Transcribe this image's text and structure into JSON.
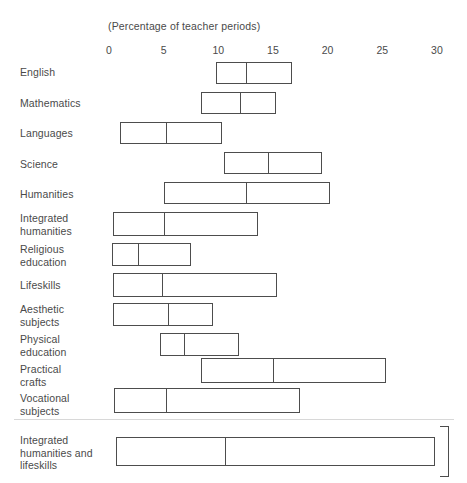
{
  "axis": {
    "caption": "(Percentage of teacher periods)",
    "ticks": [
      {
        "label": "0",
        "value": 0
      },
      {
        "label": "5",
        "value": 5
      },
      {
        "label": "10",
        "value": 10
      },
      {
        "label": "15",
        "value": 15
      },
      {
        "label": "20",
        "value": 20
      },
      {
        "label": "25",
        "value": 25
      },
      {
        "label": "30",
        "value": 30
      }
    ]
  },
  "colors": {
    "bar_outline": "#4d4d4d",
    "bar_fill": "#ffffff",
    "text": "#4a4a4a"
  },
  "chart_data": {
    "type": "bar",
    "title": "",
    "subtitle": "(Percentage of teacher periods)",
    "xlabel": "Percentage of teacher periods",
    "ylabel": "",
    "xlim": [
      0,
      30
    ],
    "grid": false,
    "legend": null,
    "orientation": "horizontal",
    "note": "Each row is a floating range bar (min to max) with an internal divider line marking the median.",
    "categories": [
      "English",
      "Mathematics",
      "Languages",
      "Science",
      "Humanities",
      "Integrated humanities",
      "Religious education",
      "Lifeskills",
      "Aesthetic subjects",
      "Physical education",
      "Practical crafts",
      "Vocational subjects",
      "Integrated humanities and lifeskills"
    ],
    "series": [
      {
        "name": "low",
        "values": [
          9.8,
          8.4,
          1.0,
          10.5,
          5.0,
          0.4,
          0.3,
          0.4,
          0.4,
          4.7,
          8.4,
          0.5,
          0.6
        ]
      },
      {
        "name": "median",
        "values": [
          12.4,
          11.9,
          5.1,
          14.5,
          12.4,
          4.9,
          2.6,
          4.8,
          5.3,
          6.8,
          14.9,
          5.1,
          10.5
        ]
      },
      {
        "name": "high",
        "values": [
          16.7,
          15.3,
          10.3,
          19.5,
          20.2,
          13.6,
          7.5,
          15.4,
          9.5,
          11.9,
          25.3,
          17.5,
          29.8
        ]
      }
    ]
  },
  "rows": [
    {
      "label": "English",
      "low": 9.8,
      "median": 12.4,
      "high": 16.7,
      "label_top": 66,
      "bar_top": 62,
      "bar_height": 22,
      "bracket": false
    },
    {
      "label": "Mathematics",
      "low": 8.4,
      "median": 11.9,
      "high": 15.3,
      "label_top": 97,
      "bar_top": 92,
      "bar_height": 22,
      "bracket": false
    },
    {
      "label": "Languages",
      "low": 1.0,
      "median": 5.1,
      "high": 10.3,
      "label_top": 127,
      "bar_top": 122,
      "bar_height": 22,
      "bracket": false
    },
    {
      "label": "Science",
      "low": 10.5,
      "median": 14.5,
      "high": 19.5,
      "label_top": 158,
      "bar_top": 152,
      "bar_height": 22,
      "bracket": false
    },
    {
      "label": "Humanities",
      "low": 5.0,
      "median": 12.4,
      "high": 20.2,
      "label_top": 188,
      "bar_top": 182,
      "bar_height": 22,
      "bracket": false
    },
    {
      "label": "Integrated\nhumanities",
      "low": 0.4,
      "median": 4.9,
      "high": 13.6,
      "label_top": 212,
      "bar_top": 212,
      "bar_height": 24,
      "bracket": false
    },
    {
      "label": "Religious\neducation",
      "low": 0.3,
      "median": 2.6,
      "high": 7.5,
      "label_top": 243,
      "bar_top": 243,
      "bar_height": 23,
      "bracket": false
    },
    {
      "label": "Lifeskills",
      "low": 0.4,
      "median": 4.8,
      "high": 15.4,
      "label_top": 279,
      "bar_top": 273,
      "bar_height": 24,
      "bracket": false
    },
    {
      "label": "Aesthetic\nsubjects",
      "low": 0.4,
      "median": 5.3,
      "high": 9.5,
      "label_top": 303,
      "bar_top": 303,
      "bar_height": 23,
      "bracket": false
    },
    {
      "label": "Physical\neducation",
      "low": 4.7,
      "median": 6.8,
      "high": 11.9,
      "label_top": 333,
      "bar_top": 333,
      "bar_height": 23,
      "bracket": false
    },
    {
      "label": "Practical\ncrafts",
      "low": 8.4,
      "median": 14.9,
      "high": 25.3,
      "label_top": 363,
      "bar_top": 358,
      "bar_height": 25,
      "bracket": false
    },
    {
      "label": "Vocational\nsubjects",
      "low": 0.5,
      "median": 5.1,
      "high": 17.5,
      "label_top": 392,
      "bar_top": 388,
      "bar_height": 25,
      "bracket": false
    },
    {
      "label": "Integrated\nhumanities and\nlifeskills",
      "low": 0.6,
      "median": 10.5,
      "high": 29.8,
      "label_top": 434,
      "bar_top": 437,
      "bar_height": 29,
      "bracket": true
    }
  ]
}
